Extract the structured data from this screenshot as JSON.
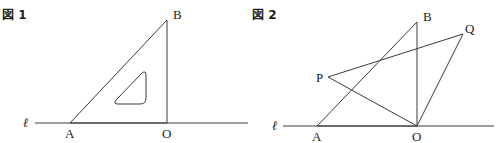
{
  "figures": [
    {
      "title": "図 1",
      "line_label": "ℓ",
      "points": {
        "A": "A",
        "B": "B",
        "O": "O"
      }
    },
    {
      "title": "図 2",
      "line_label": "ℓ",
      "points": {
        "A": "A",
        "B": "B",
        "O": "O",
        "P": "P",
        "Q": "Q"
      }
    }
  ],
  "colors": {
    "stroke": "#3a3a3a",
    "text": "#222222",
    "background": "#ffffff"
  }
}
